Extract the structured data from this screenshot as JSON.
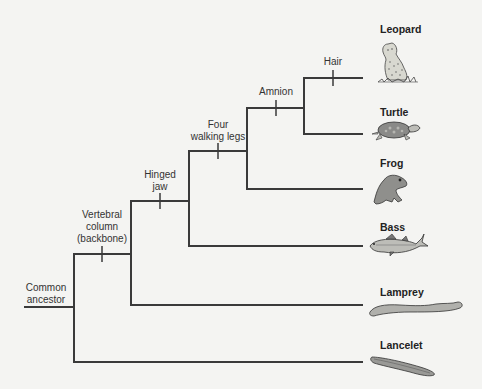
{
  "diagram": {
    "type": "cladogram",
    "root_label": "Common ancestor",
    "root_label_lines": [
      "Common",
      "ancestor"
    ],
    "traits": [
      {
        "name": "vertebral-column",
        "lines": [
          "Vertebral",
          "column",
          "(backbone)"
        ]
      },
      {
        "name": "hinged-jaw",
        "lines": [
          "Hinged",
          "jaw"
        ]
      },
      {
        "name": "four-walking-legs",
        "lines": [
          "Four",
          "walking legs"
        ]
      },
      {
        "name": "amnion",
        "lines": [
          "Amnion"
        ]
      },
      {
        "name": "hair",
        "lines": [
          "Hair"
        ]
      }
    ],
    "taxa": [
      {
        "name": "Leopard",
        "icon": "leopard-icon"
      },
      {
        "name": "Turtle",
        "icon": "turtle-icon"
      },
      {
        "name": "Frog",
        "icon": "frog-icon"
      },
      {
        "name": "Bass",
        "icon": "bass-fish-icon"
      },
      {
        "name": "Lamprey",
        "icon": "lamprey-icon"
      },
      {
        "name": "Lancelet",
        "icon": "lancelet-icon"
      }
    ],
    "colors": {
      "background": "#f4f4f2",
      "line": "#3a3a3a",
      "animal_fill": "#9a9a9a"
    }
  }
}
